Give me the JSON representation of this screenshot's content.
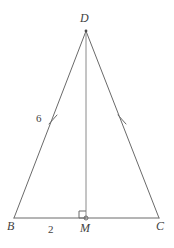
{
  "figure": {
    "type": "geometry-diagram",
    "shape": "isosceles-triangle-with-altitude",
    "background_color": "#ffffff",
    "stroke_color": "#6a6a6a",
    "text_color": "#3f3f3f",
    "width": 174,
    "height": 248
  },
  "vertices": {
    "apex": {
      "label": "D",
      "x": 86,
      "y": 31
    },
    "bottom_left": {
      "label": "B",
      "x": 14,
      "y": 218
    },
    "bottom_right": {
      "label": "C",
      "x": 159,
      "y": 218
    },
    "midpoint": {
      "label": "M",
      "x": 86,
      "y": 218
    }
  },
  "segments": [
    {
      "name": "BD",
      "from": "B",
      "to": "D",
      "length_label": "6"
    },
    {
      "name": "DC",
      "from": "D",
      "to": "C",
      "length_label": ""
    },
    {
      "name": "BC",
      "from": "B",
      "to": "C",
      "length_label": ""
    },
    {
      "name": "DM",
      "from": "D",
      "to": "M",
      "length_label": ""
    },
    {
      "name": "BM",
      "from": "B",
      "to": "M",
      "length_label": "2"
    }
  ],
  "labels": {
    "apex": "D",
    "bottom_left": "B",
    "midpoint": "M",
    "bottom_right": "C",
    "side_measure": "6",
    "base_measure": "2"
  },
  "marks": {
    "congruence_ticks": [
      {
        "on_segment": "BD",
        "x": 53,
        "y": 120,
        "count": 1
      },
      {
        "on_segment": "DC",
        "x": 122,
        "y": 120,
        "count": 1
      }
    ],
    "right_angle": {
      "at_vertex": "M",
      "size": 7,
      "orientation": "lower-left-of-altitude"
    },
    "point_dot": {
      "at_vertex": "M",
      "radius": 2
    }
  }
}
